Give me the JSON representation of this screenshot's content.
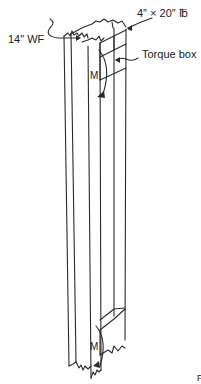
{
  "diagram": {
    "type": "engineering-isometric-sketch",
    "labels": {
      "plate": "4″ × 20″ ℔",
      "wide_flange": "14″ WF",
      "torque_box": "Torque box",
      "moment_top": "M",
      "moment_bottom": "M",
      "corner_mark": "F"
    },
    "colors": {
      "line": "#2a2a2a",
      "background": "#ffffff"
    }
  }
}
